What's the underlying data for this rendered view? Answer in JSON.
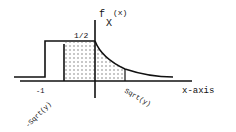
{
  "diagram": {
    "type": "probability-density-sketch",
    "function_label": {
      "main": "f",
      "subscript": "X",
      "argument": "(x)"
    },
    "level_label": "1/2",
    "tick_left": "-1",
    "x_axis_label": "x-axis",
    "lower_bound_label": "-Sqrt(y)",
    "upper_bound_label": "Sqrt(y)",
    "colors": {
      "ink": "#111111",
      "shading_dots": "#222222",
      "background": "#ffffff"
    }
  }
}
